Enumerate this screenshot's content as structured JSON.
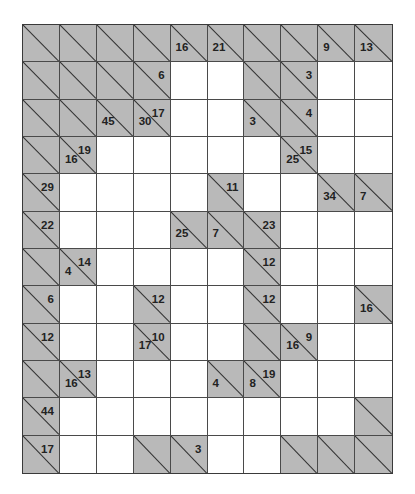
{
  "puzzle": {
    "type": "kakuro",
    "rows": 12,
    "cols": 10,
    "colors": {
      "block": "#b9b9b9",
      "line": "#333333",
      "white": "#ffffff"
    },
    "grid": [
      [
        {
          "b": 1
        },
        {
          "b": 1
        },
        {
          "b": 1
        },
        {
          "b": 1
        },
        {
          "b": 1,
          "d": "16"
        },
        {
          "b": 1,
          "d": "21"
        },
        {
          "b": 1
        },
        {
          "b": 1
        },
        {
          "b": 1,
          "d": "9"
        },
        {
          "b": 1,
          "d": "13"
        }
      ],
      [
        {
          "b": 1
        },
        {
          "b": 1
        },
        {
          "b": 1
        },
        {
          "b": 1,
          "r": "6"
        },
        {},
        {},
        {
          "b": 1
        },
        {
          "b": 1,
          "r": "3"
        },
        {},
        {}
      ],
      [
        {
          "b": 1
        },
        {
          "b": 1
        },
        {
          "b": 1,
          "d": "45"
        },
        {
          "b": 1,
          "d": "30",
          "r": "17"
        },
        {},
        {},
        {
          "b": 1,
          "d": "3"
        },
        {
          "b": 1,
          "r": "4"
        },
        {},
        {}
      ],
      [
        {
          "b": 1
        },
        {
          "b": 1,
          "d": "16",
          "r": "19"
        },
        {},
        {},
        {},
        {},
        {},
        {
          "b": 1,
          "d": "25",
          "r": "15"
        },
        {},
        {}
      ],
      [
        {
          "b": 1,
          "r": "29"
        },
        {},
        {},
        {},
        {},
        {
          "b": 1,
          "r": "11"
        },
        {},
        {},
        {
          "b": 1,
          "d": "34"
        },
        {
          "b": 1,
          "d": "7"
        }
      ],
      [
        {
          "b": 1,
          "r": "22"
        },
        {},
        {},
        {},
        {
          "b": 1,
          "d": "25"
        },
        {
          "b": 1,
          "d": "7"
        },
        {
          "b": 1,
          "r": "23"
        },
        {},
        {},
        {}
      ],
      [
        {
          "b": 1
        },
        {
          "b": 1,
          "d": "4",
          "r": "14"
        },
        {},
        {},
        {},
        {},
        {
          "b": 1,
          "r": "12"
        },
        {},
        {},
        {}
      ],
      [
        {
          "b": 1,
          "r": "6"
        },
        {},
        {},
        {
          "b": 1,
          "r": "12"
        },
        {},
        {},
        {
          "b": 1,
          "r": "12"
        },
        {},
        {},
        {
          "b": 1,
          "d": "16"
        }
      ],
      [
        {
          "b": 1,
          "r": "12"
        },
        {},
        {},
        {
          "b": 1,
          "d": "17",
          "r": "10"
        },
        {},
        {},
        {
          "b": 1
        },
        {
          "b": 1,
          "d": "16",
          "r": "9"
        },
        {},
        {}
      ],
      [
        {
          "b": 1
        },
        {
          "b": 1,
          "d": "16",
          "r": "13"
        },
        {},
        {},
        {},
        {
          "b": 1,
          "d": "4"
        },
        {
          "b": 1,
          "d": "8",
          "r": "19"
        },
        {},
        {},
        {}
      ],
      [
        {
          "b": 1,
          "r": "44"
        },
        {},
        {},
        {},
        {},
        {},
        {},
        {},
        {},
        {
          "b": 1
        }
      ],
      [
        {
          "b": 1,
          "r": "17"
        },
        {},
        {},
        {
          "b": 1
        },
        {
          "b": 1,
          "r": "3"
        },
        {},
        {},
        {
          "b": 1
        },
        {
          "b": 1
        },
        {
          "b": 1
        }
      ]
    ]
  }
}
